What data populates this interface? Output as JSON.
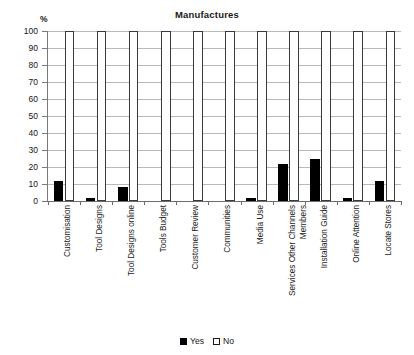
{
  "chart_data": {
    "type": "bar",
    "title": "Manufactures",
    "xlabel": "",
    "ylabel": "%",
    "ylim": [
      0,
      100
    ],
    "ytick_step": 10,
    "yticks": [
      100,
      90,
      80,
      70,
      60,
      50,
      40,
      30,
      20,
      10,
      0
    ],
    "grid": true,
    "legend_position": "bottom",
    "categories": [
      "Customisation",
      "Tool Designs",
      "Tool Designs online",
      "Tools Budget",
      "Customer Review",
      "Communities",
      "Media Use",
      "Services Other Channels Members",
      "Installation  Guide",
      "Online Attention",
      "Locate Stores"
    ],
    "category_lines": [
      [
        "Customisation"
      ],
      [
        "Tool Designs"
      ],
      [
        "Tool Designs online"
      ],
      [
        "Tools Budget"
      ],
      [
        "Customer Review"
      ],
      [
        "Communities"
      ],
      [
        "Media Use"
      ],
      [
        "Services Other Channels",
        "Members"
      ],
      [
        "Installation  Guide"
      ],
      [
        "Online Attention"
      ],
      [
        "Locate Stores"
      ]
    ],
    "series": [
      {
        "name": "Yes",
        "color": "#000000",
        "values": [
          12,
          2,
          8,
          0,
          0,
          0,
          2,
          22,
          25,
          2,
          12
        ]
      },
      {
        "name": "No",
        "color": "#ffffff",
        "values": [
          100,
          100,
          100,
          100,
          100,
          100,
          100,
          100,
          100,
          100,
          100
        ]
      }
    ]
  },
  "legend": {
    "items": [
      {
        "label": "Yes",
        "swatch": "filled-square"
      },
      {
        "label": "No",
        "swatch": "open-square"
      }
    ]
  }
}
